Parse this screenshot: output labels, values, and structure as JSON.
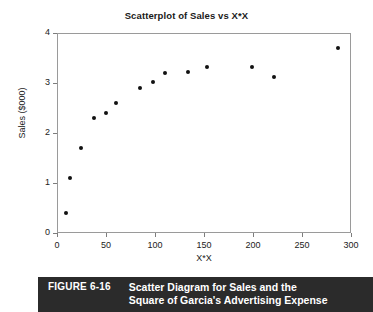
{
  "figure": {
    "number_label": "FIGURE 6-16",
    "caption_line1": "Scatter Diagram for Sales and the",
    "caption_line2": "Square of Garcia's Advertising Expense",
    "caption_bar_color": "#2b2b2b",
    "caption_text_color": "#ffffff"
  },
  "chart_data": {
    "type": "scatter",
    "title": "Scatterplot of Sales vs X*X",
    "xlabel": "X*X",
    "ylabel": "Sales ($000)",
    "xlim": [
      0,
      300
    ],
    "ylim": [
      0,
      4
    ],
    "xticks": [
      0,
      50,
      100,
      150,
      200,
      250,
      300
    ],
    "xtick_labels": [
      "0",
      "50",
      "100",
      "150",
      "200",
      "250",
      "300"
    ],
    "yticks": [
      0,
      1,
      2,
      3,
      4
    ],
    "ytick_labels": [
      "0",
      "1",
      "2",
      "3",
      "4"
    ],
    "grid": false,
    "legend": null,
    "marker": "filled-circle",
    "marker_color": "#111111",
    "points": [
      {
        "x": 9,
        "y": 0.4
      },
      {
        "x": 13,
        "y": 1.1
      },
      {
        "x": 24,
        "y": 1.7
      },
      {
        "x": 38,
        "y": 2.3
      },
      {
        "x": 50,
        "y": 2.4
      },
      {
        "x": 60,
        "y": 2.6
      },
      {
        "x": 85,
        "y": 2.91
      },
      {
        "x": 98,
        "y": 3.02
      },
      {
        "x": 110,
        "y": 3.21
      },
      {
        "x": 134,
        "y": 3.22
      },
      {
        "x": 153,
        "y": 3.32
      },
      {
        "x": 199,
        "y": 3.32
      },
      {
        "x": 221,
        "y": 3.12
      },
      {
        "x": 287,
        "y": 3.71
      }
    ]
  }
}
